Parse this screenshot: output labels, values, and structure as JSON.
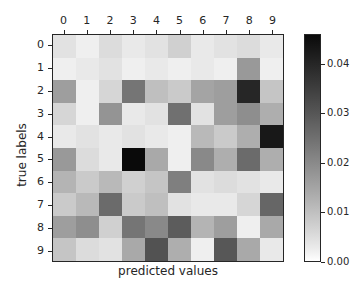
{
  "chart_data": {
    "type": "heatmap",
    "title": "",
    "xlabel": "predicted values",
    "ylabel": "true labels",
    "x_tick_labels": [
      "0",
      "1",
      "2",
      "3",
      "4",
      "5",
      "6",
      "7",
      "8",
      "9"
    ],
    "y_tick_labels": [
      "0",
      "1",
      "2",
      "3",
      "4",
      "5",
      "6",
      "7",
      "8",
      "9"
    ],
    "x_axis_position": "top",
    "grid": false,
    "colormap": "Greys",
    "colorbar": {
      "vmin": 0.0,
      "vmax": 0.046,
      "tick_values": [
        0.0,
        0.01,
        0.02,
        0.03,
        0.04
      ],
      "tick_labels": [
        "0.00",
        "0.01",
        "0.02",
        "0.03",
        "0.04"
      ],
      "position": "right",
      "orientation": "vertical"
    },
    "row_labels": [
      "0",
      "1",
      "2",
      "3",
      "4",
      "5",
      "6",
      "7",
      "8",
      "9"
    ],
    "col_labels": [
      "0",
      "1",
      "2",
      "3",
      "4",
      "5",
      "6",
      "7",
      "8",
      "9"
    ],
    "values": [
      [
        0.004,
        0.002,
        0.005,
        0.003,
        0.004,
        0.007,
        0.003,
        0.004,
        0.005,
        0.003
      ],
      [
        0.002,
        0.003,
        0.004,
        0.002,
        0.003,
        0.002,
        0.003,
        0.002,
        0.017,
        0.002
      ],
      [
        0.016,
        0.002,
        0.006,
        0.024,
        0.01,
        0.008,
        0.015,
        0.016,
        0.04,
        0.009
      ],
      [
        0.006,
        0.002,
        0.018,
        0.003,
        0.004,
        0.025,
        0.004,
        0.016,
        0.019,
        0.013
      ],
      [
        0.003,
        0.004,
        0.003,
        0.004,
        0.003,
        0.002,
        0.011,
        0.008,
        0.013,
        0.043
      ],
      [
        0.017,
        0.005,
        0.003,
        0.046,
        0.014,
        0.002,
        0.02,
        0.013,
        0.026,
        0.013
      ],
      [
        0.012,
        0.008,
        0.011,
        0.007,
        0.009,
        0.022,
        0.004,
        0.005,
        0.004,
        0.003
      ],
      [
        0.008,
        0.011,
        0.026,
        0.008,
        0.01,
        0.004,
        0.003,
        0.003,
        0.006,
        0.027
      ],
      [
        0.016,
        0.019,
        0.007,
        0.024,
        0.02,
        0.029,
        0.012,
        0.016,
        0.002,
        0.014
      ],
      [
        0.009,
        0.005,
        0.004,
        0.014,
        0.031,
        0.013,
        0.002,
        0.03,
        0.014,
        0.003
      ]
    ]
  }
}
